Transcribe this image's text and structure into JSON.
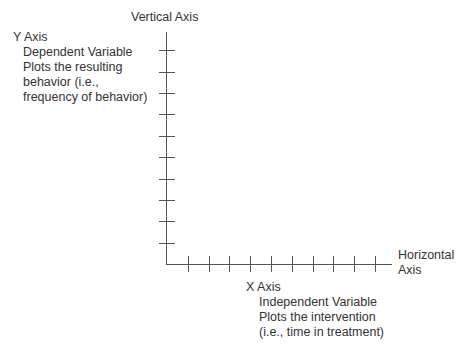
{
  "diagram": {
    "vertical_axis_title": "Vertical Axis",
    "horizontal_axis_title": [
      "Horizontal",
      "Axis"
    ],
    "y_axis": {
      "heading": "Y Axis",
      "lines": [
        "Dependent Variable",
        "Plots the resulting",
        "behavior (i.e.,",
        "frequency of behavior)"
      ]
    },
    "x_axis": {
      "heading": "X Axis",
      "lines": [
        "Independent Variable",
        "Plots the intervention",
        "(i.e., time in treatment)"
      ]
    },
    "y_tick_count": 10,
    "x_tick_count": 10,
    "colors": {
      "line": "#555555",
      "text": "#333333"
    }
  }
}
